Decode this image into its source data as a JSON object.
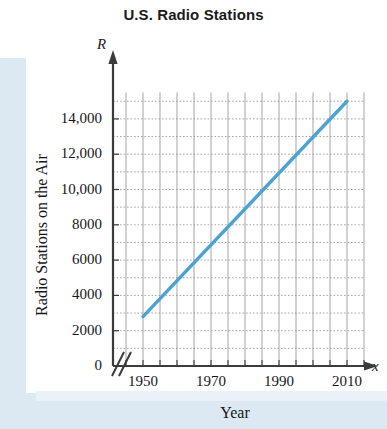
{
  "title": "U.S. Radio Stations",
  "axis_vars": {
    "y": "R",
    "x": "x"
  },
  "axis_titles": {
    "y": "Radio Stations on the Air",
    "x": "Year"
  },
  "colors": {
    "line": "#4BA3D3",
    "axis": "#3b3b3b",
    "grid": "#9a9a9a",
    "tint": "#dce9f2",
    "text": "#16171a"
  },
  "chart_data": {
    "type": "line",
    "title": "U.S. Radio Stations",
    "xlabel": "Year",
    "ylabel": "Radio Stations on the Air",
    "x": [
      1950,
      2010
    ],
    "values": [
      2800,
      15000
    ],
    "series": [
      {
        "name": "Radio Stations on the Air",
        "x": [
          1950,
          1960,
          1970,
          1980,
          1990,
          2000,
          2010
        ],
        "values": [
          2800,
          4850,
          6850,
          8900,
          10950,
          13000,
          15000
        ]
      }
    ],
    "xlim": [
      1945,
      2015
    ],
    "ylim": [
      0,
      15500
    ],
    "xticks": [
      1950,
      1970,
      1990,
      2010
    ],
    "xtick_labels": [
      "1950",
      "1970",
      "1990",
      "2010"
    ],
    "xtick_minor_step": 5,
    "yticks": [
      0,
      2000,
      4000,
      6000,
      8000,
      10000,
      12000,
      14000
    ],
    "ytick_labels": [
      "0",
      "2000",
      "4000",
      "6000",
      "8000",
      "10,000",
      "12,000",
      "14,000"
    ],
    "ytick_minor_step": 1000,
    "grid": true,
    "grid_style": "dotted",
    "legend": null,
    "axis_break": {
      "axis": "x",
      "symbol": "//",
      "note": "double-slash break between origin and 1950"
    }
  },
  "ytick_positions_px": [
    366,
    330.7,
    295.4,
    260.1,
    224.8,
    189.5,
    154.2,
    118.9
  ],
  "xtick_positions_px": [
    143,
    211,
    279,
    347
  ]
}
